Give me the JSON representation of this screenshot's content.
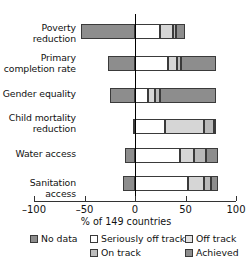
{
  "chart_data": {
    "type": "bar",
    "orientation": "horizontal",
    "stacked": true,
    "title": "",
    "xlabel": "% of 149 countries",
    "ylabel": "",
    "xlim": [
      -100,
      100
    ],
    "xticks": [
      -100,
      -50,
      0,
      50,
      100
    ],
    "xtick_labels": [
      "–100",
      "–50",
      "0",
      "50",
      "100"
    ],
    "grid": false,
    "legend_position": "bottom",
    "categories": [
      "Poverty\nreduction",
      "Primary\ncompletion rate",
      "Gender equality",
      "Child mortality\nreduction",
      "Water access",
      "Sanitation access"
    ],
    "series": [
      {
        "name": "No data",
        "color": "#8d8d8d",
        "values": [
          -53,
          -27,
          -25,
          -2,
          -10,
          -12
        ]
      },
      {
        "name": "Seriously off track",
        "color": "#ffffff",
        "values": [
          25,
          33,
          13,
          30,
          45,
          52
        ]
      },
      {
        "name": "Off track",
        "color": "#d6d6d6",
        "values": [
          13,
          9,
          7,
          38,
          13,
          16
        ]
      },
      {
        "name": "On track",
        "color": "#b9b9b9",
        "values": [
          3,
          4,
          5,
          10,
          12,
          7
        ]
      },
      {
        "name": "Achieved",
        "color": "#8d8d8d",
        "values": [
          9,
          34,
          55,
          2,
          12,
          7
        ]
      }
    ]
  },
  "legend": {
    "entries": [
      {
        "label": "No data",
        "color": "#8d8d8d"
      },
      {
        "label": "Seriously off track",
        "color": "#ffffff"
      },
      {
        "label": "Off track",
        "color": "#e2e2e2"
      },
      {
        "label": "On track",
        "color": "#bdbdbd"
      },
      {
        "label": "Achieved",
        "color": "#8d8d8d"
      }
    ]
  },
  "colors": {
    "axis": "#333333",
    "bar_outline": "#3a3a3a",
    "background": "#ffffff",
    "text": "#111111"
  }
}
